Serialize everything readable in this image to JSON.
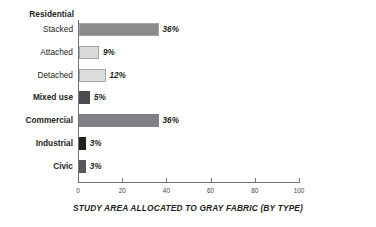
{
  "chart_data": {
    "type": "bar",
    "orientation": "horizontal",
    "title": "",
    "caption": "STUDY AREA ALLOCATED TO GRAY FABRIC (BY TYPE)",
    "xlabel": "",
    "ylabel": "",
    "xlim": [
      0,
      100
    ],
    "grid": false,
    "legend": false,
    "group_header": "Residential",
    "xticks": [
      {
        "value": 0,
        "label": "0"
      },
      {
        "value": 20,
        "label": "20"
      },
      {
        "value": 40,
        "label": "40"
      },
      {
        "value": 60,
        "label": "60"
      },
      {
        "value": 80,
        "label": "80"
      },
      {
        "value": 100,
        "label": "100"
      }
    ],
    "categories": [
      "Stacked",
      "Attached",
      "Detached",
      "Mixed use",
      "Commercial",
      "Industrial",
      "Civic"
    ],
    "values": [
      36,
      9,
      12,
      5,
      36,
      3,
      3
    ],
    "value_labels": [
      "36%",
      "9%",
      "12%",
      "5%",
      "36%",
      "3%",
      "3%"
    ],
    "bars": [
      {
        "label": "Stacked",
        "value": 36,
        "value_label": "36%",
        "color": "#8a8b8d",
        "outlined": true,
        "label_style": "sub"
      },
      {
        "label": "Attached",
        "value": 9,
        "value_label": "9%",
        "color": "#d8d9da",
        "outlined": true,
        "label_style": "sub"
      },
      {
        "label": "Detached",
        "value": 12,
        "value_label": "12%",
        "color": "#dcdddd",
        "outlined": true,
        "label_style": "sub"
      },
      {
        "label": "Mixed use",
        "value": 5,
        "value_label": "5%",
        "color": "#4b4c4e",
        "outlined": false,
        "label_style": "main"
      },
      {
        "label": "Commercial",
        "value": 36,
        "value_label": "36%",
        "color": "#808184",
        "outlined": false,
        "label_style": "main"
      },
      {
        "label": "Industrial",
        "value": 3,
        "value_label": "3%",
        "color": "#231f20",
        "outlined": false,
        "label_style": "main"
      },
      {
        "label": "Civic",
        "value": 3,
        "value_label": "3%",
        "color": "#58595b",
        "outlined": false,
        "label_style": "main"
      }
    ]
  }
}
